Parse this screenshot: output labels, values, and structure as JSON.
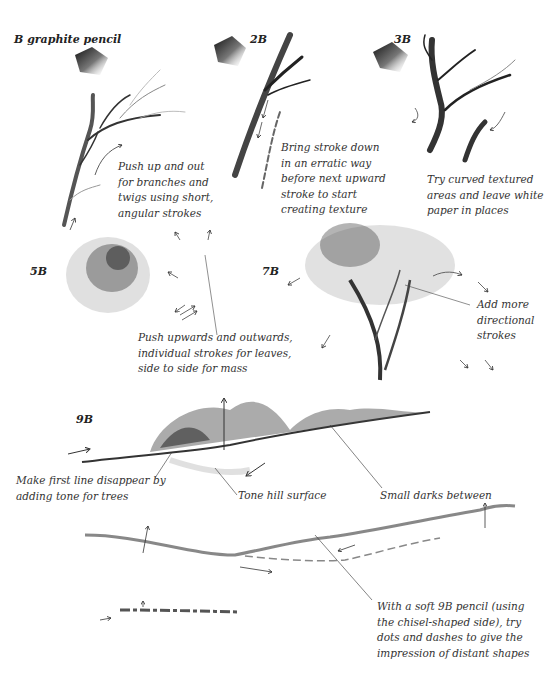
{
  "title": "B graphite pencil",
  "grades": {
    "b2": "2B",
    "b3": "3B",
    "b5": "5B",
    "b7": "7B",
    "b9": "9B"
  },
  "annotations": {
    "branches": [
      "Push up and out",
      "for branches and",
      "twigs using short,",
      "angular strokes"
    ],
    "stroke_down": [
      "Bring stroke down",
      "in an erratic way",
      "before next upward",
      "stroke to start",
      "creating texture"
    ],
    "curved": [
      "Try curved textured",
      "areas and leave white",
      "paper in places"
    ],
    "leaves": [
      "Push upwards and outwards,",
      "individual strokes for leaves,",
      "side to side for mass"
    ],
    "directional": [
      "Add more",
      "directional",
      "strokes"
    ],
    "first_line": [
      "Make first line disappear by",
      "adding tone for trees"
    ],
    "tone_hill": "Tone hill surface",
    "small_darks": "Small darks between",
    "soft_pencil": [
      "With a soft 9B pencil (using",
      "the chisel-shaped side), try",
      "dots and dashes to give the",
      "impression of distant shapes"
    ]
  },
  "icons": {
    "swatch": "graphite-swatch",
    "arrow": "direction-arrow"
  }
}
